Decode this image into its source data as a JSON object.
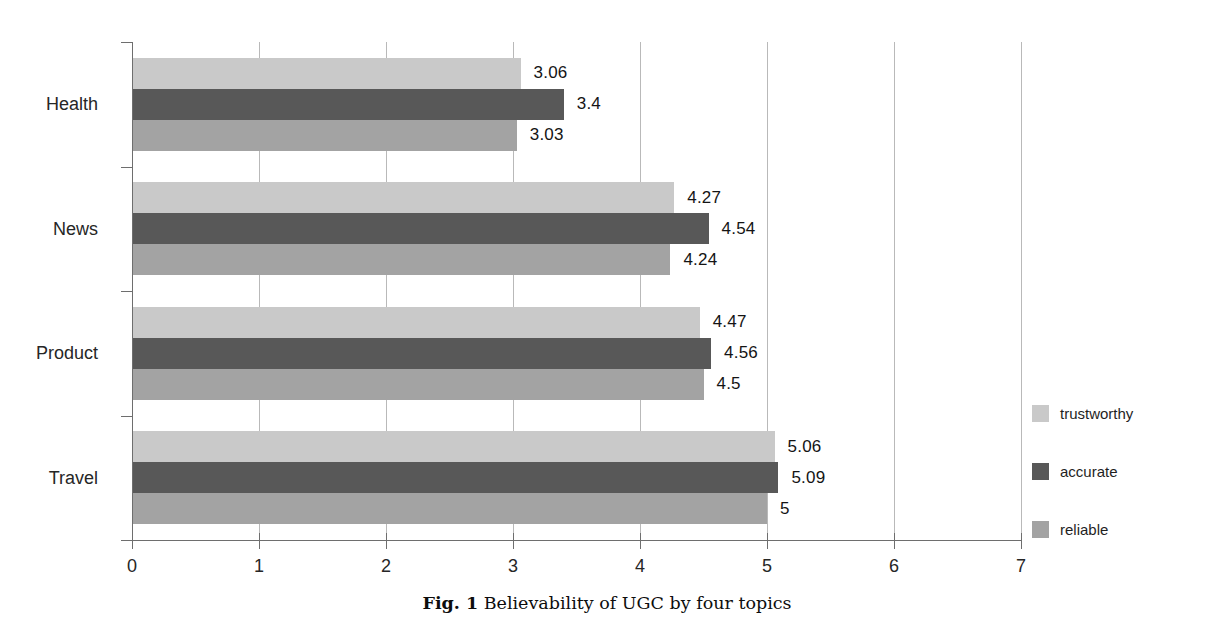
{
  "chart_data": {
    "type": "bar",
    "orientation": "horizontal",
    "title": "",
    "caption_prefix": "Fig. 1",
    "caption_text": "Believability of UGC by four topics",
    "xlabel": "",
    "ylabel": "",
    "xlim": [
      0,
      7
    ],
    "xticks": [
      "0",
      "1",
      "2",
      "3",
      "4",
      "5",
      "6",
      "7"
    ],
    "grid": true,
    "legend_position": "right",
    "categories": [
      "Health",
      "News",
      "Product",
      "Travel"
    ],
    "series": [
      {
        "name": "trustworthy",
        "color": "#c9c9c9",
        "values": [
          3.06,
          4.27,
          4.47,
          5.06
        ],
        "labels": [
          "3.06",
          "4.27",
          "4.47",
          "5.06"
        ]
      },
      {
        "name": "accurate",
        "color": "#585858",
        "values": [
          3.4,
          4.54,
          4.56,
          5.09
        ],
        "labels": [
          "3.4",
          "4.54",
          "4.56",
          "5.09"
        ]
      },
      {
        "name": "reliable",
        "color": "#a3a3a3",
        "values": [
          3.03,
          4.24,
          4.5,
          5.0
        ],
        "labels": [
          "3.03",
          "4.24",
          "4.5",
          "5"
        ]
      }
    ]
  },
  "legend": {
    "items": [
      {
        "label": "trustworthy",
        "color": "#c9c9c9"
      },
      {
        "label": "accurate",
        "color": "#585858"
      },
      {
        "label": "reliable",
        "color": "#a3a3a3"
      }
    ]
  },
  "colors": {
    "axis": "#6e6e6e",
    "grid": "#b9b9b9",
    "background": "#ffffff",
    "text": "#1a1a1a"
  }
}
